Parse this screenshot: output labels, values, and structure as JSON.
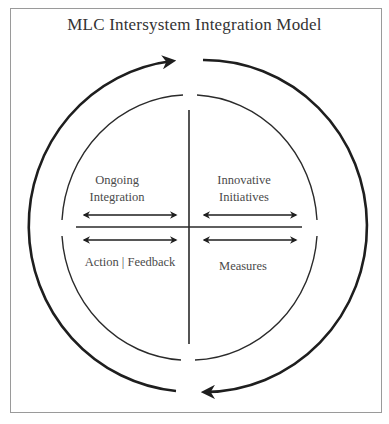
{
  "title": "MLC Intersystem Integration Model",
  "quadrants": {
    "top_left": {
      "lines": [
        "Ongoing",
        "Integration"
      ]
    },
    "top_right": {
      "lines": [
        "Innovative",
        "Initiatives"
      ]
    },
    "bottom_left": {
      "lines": [
        "Action | Feedback"
      ]
    },
    "bottom_right": {
      "lines": [
        "Measures"
      ]
    }
  },
  "colors": {
    "stroke": "#1e1e1e",
    "frame": "#9a9a9a",
    "text": "#4a4a4a"
  }
}
